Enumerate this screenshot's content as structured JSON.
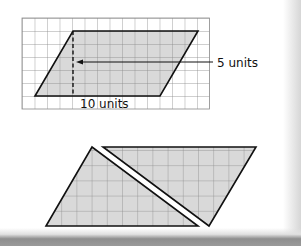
{
  "figure_top": {
    "title": "Parallelogram on grid",
    "height_label": "5 units",
    "base_label": "10 units",
    "grid": {
      "x": 22,
      "y": 18,
      "cols": 15,
      "rows": 7,
      "cell_w": 12.5,
      "cell_h": 13
    },
    "parallelogram": {
      "points": "35,96 73,31 198,31 160,96"
    },
    "height_line": {
      "x": 73,
      "y1": 31,
      "y2": 96
    },
    "arrow": {
      "x1": 213,
      "x2": 76,
      "y": 62
    }
  },
  "figure_bottom": {
    "title": "Parallelogram cut into two triangles",
    "left_triangle": {
      "points": "46,226 92,147 198,226"
    },
    "right_triangle": {
      "points": "103,147 256,147 209,226"
    },
    "cell": 15.2
  },
  "colors": {
    "fill": "#d9d9d9",
    "grid_line": "#8a8a8a",
    "outline": "#111111"
  }
}
